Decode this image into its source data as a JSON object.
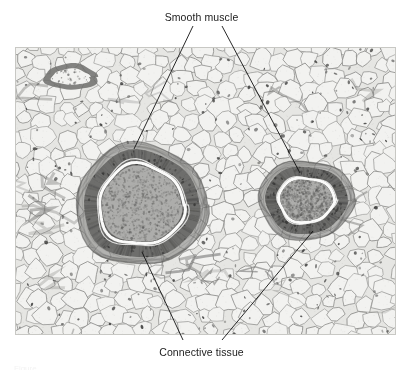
{
  "figure": {
    "type": "histology-micrograph",
    "stain_appearance": "grayscale light micrograph",
    "background_color": "#ffffff",
    "image_border_color": "#c8c8c4"
  },
  "labels": {
    "smooth_muscle": "Smooth muscle",
    "connective_tissue": "Connective tissue"
  },
  "leader_lines": [
    {
      "name": "smooth-muscle-left",
      "label": "Smooth muscle",
      "from": {
        "x": 193,
        "y": 26
      },
      "to": {
        "x": 134,
        "y": 149
      }
    },
    {
      "name": "smooth-muscle-right",
      "label": "Smooth muscle",
      "from": {
        "x": 222,
        "y": 26
      },
      "to": {
        "x": 300,
        "y": 173
      }
    },
    {
      "name": "connective-tissue-left",
      "label": "Connective tissue",
      "from": {
        "x": 142,
        "y": 252
      },
      "to": {
        "x": 183,
        "y": 340
      }
    },
    {
      "name": "connective-tissue-right",
      "label": "Connective tissue",
      "from": {
        "x": 313,
        "y": 231
      },
      "to": {
        "x": 222,
        "y": 340
      }
    }
  ],
  "micrograph": {
    "bounds": {
      "x": 15,
      "y": 47,
      "width": 381,
      "height": 288
    },
    "tissue_colors": {
      "adipose_cell_fill": "#f2f2f0",
      "adipose_cell_border": "#8e8e8c",
      "background_tissue": "#e6e6e3",
      "smooth_muscle_ring": "#6e6e6c",
      "smooth_muscle_dark": "#4f4f4e",
      "lumen_contents": "#adadab",
      "internal_elastic_lamina": "#fbfbfa",
      "connective_tissue": "#7d7d7b",
      "nuclei": "#343433"
    },
    "structures": [
      {
        "name": "large-artery",
        "description": "Large muscular artery with thick smooth muscle tunica media and granular lumen",
        "center": {
          "x": 126,
          "y": 158
        },
        "outer_radius_x": 66,
        "outer_radius_y": 61,
        "media_outer_rx": 58,
        "media_outer_ry": 54,
        "lumen_rx": 40,
        "lumen_ry": 38
      },
      {
        "name": "small-artery",
        "description": "Smaller muscular artery with smooth muscle wall and granular lumen",
        "center": {
          "x": 291,
          "y": 153
        },
        "outer_radius_x": 48,
        "outer_radius_y": 40,
        "media_outer_rx": 41,
        "media_outer_ry": 34,
        "lumen_rx": 26,
        "lumen_ry": 21
      },
      {
        "name": "small-venule-upper-left",
        "description": "Small collapsed venule in upper left adipose field",
        "center": {
          "x": 56,
          "y": 30
        },
        "outer_radius_x": 27,
        "outer_radius_y": 13
      }
    ]
  },
  "caption_sliver": "Figure"
}
